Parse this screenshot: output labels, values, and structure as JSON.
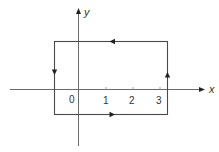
{
  "diagram": {
    "type": "closed-contour-on-axes",
    "axes": {
      "x_label": "x",
      "y_label": "y",
      "origin_label": "0",
      "x_ticks": [
        "1",
        "2",
        "3"
      ]
    },
    "contour": {
      "shape": "rectangle",
      "orientation": "counter-clockwise",
      "x_range": [
        -0.9,
        3.3
      ],
      "y_range": [
        -0.9,
        1.8
      ],
      "arrows": [
        {
          "edge": "top",
          "direction": "left"
        },
        {
          "edge": "left",
          "direction": "down"
        },
        {
          "edge": "bottom",
          "direction": "right"
        },
        {
          "edge": "right",
          "direction": "up"
        }
      ]
    },
    "colors": {
      "line": "#4a4a4a",
      "axis": "#6b6b6b",
      "background": "#ffffff"
    }
  }
}
